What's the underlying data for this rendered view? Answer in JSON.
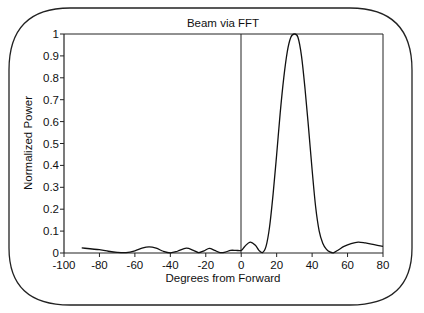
{
  "chart_data": {
    "type": "line",
    "title": "Beam via FFT",
    "xlabel": "Degrees from Forward",
    "ylabel": "Normalized Power",
    "xlim": [
      -100,
      80
    ],
    "ylim": [
      0,
      1
    ],
    "grid": false,
    "legend": null,
    "x_ticks": [
      -100,
      -80,
      -60,
      -40,
      -20,
      0,
      20,
      40,
      60,
      80
    ],
    "y_ticks": [
      0,
      0.1,
      0.2,
      0.3,
      0.4,
      0.5,
      0.6,
      0.7,
      0.8,
      0.9,
      1
    ],
    "x_tick_labels": [
      "-100",
      "-80",
      "-60",
      "-40",
      "-20",
      "0",
      "20",
      "40",
      "60",
      "80"
    ],
    "y_tick_labels": [
      "0",
      "0.1",
      "0.2",
      "0.3",
      "0.4",
      "0.5",
      "0.6",
      "0.7",
      "0.8",
      "0.9",
      "1"
    ],
    "annotations": [
      "vertical reference line at x = 0"
    ],
    "series": [
      {
        "name": "Beam power",
        "x": [
          -90,
          -80,
          -75,
          -70,
          -65,
          -60,
          -56,
          -52,
          -48,
          -44,
          -40,
          -36,
          -31,
          -27,
          -24,
          -21,
          -18,
          -15,
          -12,
          -9,
          -6,
          -3,
          0,
          2,
          5,
          8,
          10,
          12,
          14,
          16,
          18,
          20,
          22,
          24,
          26,
          28,
          30,
          32,
          34,
          36,
          38,
          40,
          42,
          44,
          46,
          48,
          50,
          52,
          55,
          58,
          62,
          66,
          70,
          75,
          80
        ],
        "values": [
          0.023,
          0.015,
          0.008,
          0.003,
          0.002,
          0.01,
          0.022,
          0.028,
          0.022,
          0.008,
          0.001,
          0.008,
          0.022,
          0.012,
          0.002,
          0.01,
          0.021,
          0.012,
          0.002,
          0.004,
          0.012,
          0.012,
          0.012,
          0.03,
          0.05,
          0.035,
          0.012,
          0.002,
          0.03,
          0.12,
          0.27,
          0.45,
          0.64,
          0.8,
          0.92,
          0.985,
          1.0,
          0.985,
          0.9,
          0.75,
          0.57,
          0.38,
          0.21,
          0.1,
          0.045,
          0.018,
          0.005,
          0.001,
          0.015,
          0.03,
          0.043,
          0.05,
          0.046,
          0.038,
          0.03
        ]
      }
    ]
  },
  "labels": {
    "title": "Beam via FFT",
    "xlabel": "Degrees from Forward",
    "ylabel": "Normalized Power",
    "x_ticks": [
      "-100",
      "-80",
      "-60",
      "-40",
      "-20",
      "0",
      "20",
      "40",
      "60",
      "80"
    ],
    "y_ticks": [
      "0",
      "0.1",
      "0.2",
      "0.3",
      "0.4",
      "0.5",
      "0.6",
      "0.7",
      "0.8",
      "0.9",
      "1"
    ]
  },
  "colors": {
    "line": "#111111",
    "axes": "#222222",
    "background": "#ffffff"
  }
}
